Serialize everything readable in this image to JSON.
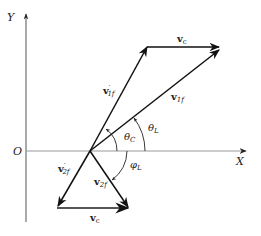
{
  "diagram": {
    "axes": {
      "x_label": "X",
      "y_label": "Y",
      "origin_label": "O"
    },
    "vectors": {
      "v_c_top": {
        "main": "v",
        "sub": "c",
        "sup": ""
      },
      "v1f_prime": {
        "main": "v",
        "sub": "1f",
        "sup": "′"
      },
      "v1f": {
        "main": "v",
        "sub": "1f",
        "sup": ""
      },
      "v2f_prime": {
        "main": "v",
        "sub": "2f",
        "sup": "′"
      },
      "v2f": {
        "main": "v",
        "sub": "2f",
        "sup": ""
      },
      "v_c_bottom": {
        "main": "v",
        "sub": "c",
        "sup": ""
      }
    },
    "angles": {
      "theta_c": {
        "main": "θ",
        "sub": "C"
      },
      "theta_l": {
        "main": "θ",
        "sub": "L"
      },
      "phi_l": {
        "main": "φ",
        "sub": "L"
      }
    },
    "colors": {
      "axis": "#888888",
      "vector": "#111111"
    }
  }
}
